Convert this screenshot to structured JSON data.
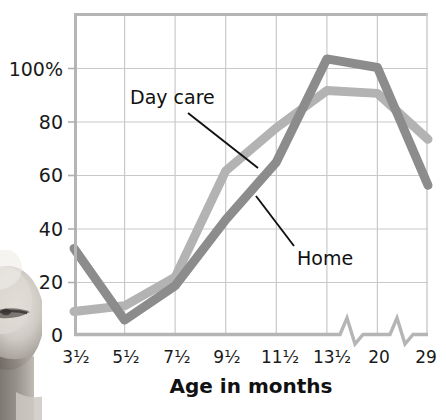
{
  "chart_data": {
    "type": "line",
    "title": "",
    "subtitle": "",
    "xlabel": "Age in months",
    "ylabel": "",
    "categories": [
      "3¹⁄₂",
      "5¹⁄₂",
      "7¹⁄₂",
      "9¹⁄₂",
      "11¹⁄₂",
      "13¹⁄₂",
      "20",
      "29"
    ],
    "x_tick_labels": [
      "3¹⁄₂",
      "5¹⁄₂",
      "7¹⁄₂",
      "9¹⁄₂",
      "11¹⁄₂",
      "13¹⁄₂",
      "20",
      "29"
    ],
    "y_tick_labels": [
      "0",
      "20",
      "40",
      "60",
      "80",
      "100%"
    ],
    "y_tick_values": [
      0,
      20,
      40,
      60,
      80,
      100
    ],
    "ylim": [
      0,
      112
    ],
    "grid": true,
    "legend_position": "inline-annotations",
    "axis_breaks": [
      "between 13¹⁄₂ and 20",
      "between 20 and 29"
    ],
    "series": [
      {
        "name": "Day care",
        "color": "#b3b3b3",
        "values": [
          8,
          10,
          20,
          57,
          72,
          85,
          84,
          68
        ]
      },
      {
        "name": "Home",
        "color": "#8c8c8c",
        "values": [
          30,
          5,
          17,
          40,
          60,
          96,
          93,
          52
        ]
      }
    ],
    "annotations": [
      {
        "label": "Day care",
        "series": "Day care",
        "text_x": 130,
        "text_y": 100,
        "leader_from_x": 185,
        "leader_from_y": 112,
        "leader_to_x": 258,
        "leader_to_y": 167
      },
      {
        "label": "Home",
        "series": "Home",
        "text_x": 297,
        "text_y": 258,
        "leader_from_x": 293,
        "leader_from_y": 242,
        "leader_to_x": 256,
        "leader_to_y": 195
      }
    ]
  },
  "colors": {
    "day_care_line": "#b3b3b3",
    "home_line": "#8c8c8c",
    "grid": "#c8c8c8",
    "axis": "#b0b0b0",
    "text": "#1a1a1a",
    "background": "#ffffff"
  },
  "axis_label": {
    "x_title": "Age in months"
  },
  "photo": {
    "description": "grayscale-photo-fragment-face"
  }
}
